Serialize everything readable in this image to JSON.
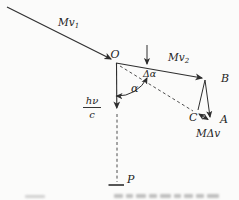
{
  "figure": {
    "labels": {
      "mv1_base": "Mv",
      "mv1_sub": "1",
      "mv2_base": "Mv",
      "mv2_sub": "2",
      "point_o": "O",
      "point_b": "B",
      "point_c": "C",
      "point_a": "A",
      "point_p": "P",
      "angle_alpha": "α",
      "angle_delta_alpha": "Δα",
      "m_delta_v": "MΔv",
      "photon_numerator": "hν",
      "photon_denominator": "c"
    },
    "colors": {
      "stroke": "#2e2e2e",
      "dashed_stroke": "#4f4f4f",
      "background": "#fbfbfa",
      "caption_gray": "#8f8f8f"
    }
  }
}
